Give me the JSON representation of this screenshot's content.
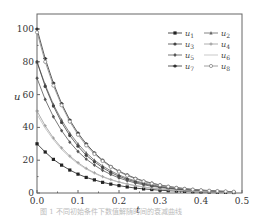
{
  "chart_data": {
    "type": "line",
    "title": "",
    "xlabel": "t",
    "ylabel": "u",
    "xlim": [
      0.0,
      0.5
    ],
    "ylim": [
      0,
      100
    ],
    "xticks": [
      "0.0",
      "0.1",
      "0.2",
      "0.3",
      "0.4",
      "0.5"
    ],
    "yticks": [
      "0",
      "20",
      "40",
      "60",
      "80",
      "100"
    ],
    "grid": false,
    "legend_position": "upper right",
    "x": [
      0.0,
      0.02,
      0.04,
      0.06,
      0.08,
      0.1,
      0.12,
      0.14,
      0.16,
      0.18,
      0.2,
      0.22,
      0.24,
      0.26,
      0.28,
      0.3,
      0.32,
      0.34,
      0.36,
      0.38,
      0.4,
      0.42,
      0.44,
      0.46,
      0.48
    ],
    "series": [
      {
        "name": "u1",
        "color": "#222222",
        "marker": "square",
        "values": [
          30,
          25,
          20.5,
          17,
          14,
          11.5,
          9.5,
          8,
          6.5,
          5.4,
          4.5,
          3.7,
          3.0,
          2.5,
          2.1,
          1.7,
          1.4,
          1.2,
          1.0,
          0.8,
          0.7,
          0.6,
          0.5,
          0.4,
          0.3
        ]
      },
      {
        "name": "u2",
        "color": "#666666",
        "marker": "triangle",
        "values": [
          80,
          66,
          54,
          44.5,
          36.5,
          30,
          24.5,
          20,
          16.5,
          13.5,
          11,
          9,
          7.4,
          6.1,
          5.0,
          4.1,
          3.4,
          2.8,
          2.3,
          1.9,
          1.5,
          1.3,
          1.0,
          0.9,
          0.7
        ]
      },
      {
        "name": "u3",
        "color": "#444444",
        "marker": "circle",
        "values": [
          80,
          65,
          53,
          43,
          35,
          28.5,
          23,
          19,
          15.5,
          12.5,
          10.2,
          8.3,
          6.8,
          5.5,
          4.5,
          3.7,
          3.0,
          2.4,
          2.0,
          1.6,
          1.3,
          1.1,
          0.9,
          0.7,
          0.6
        ]
      },
      {
        "name": "u4",
        "color": "#999999",
        "marker": "plus",
        "values": [
          50,
          41,
          33.5,
          27.5,
          22.5,
          18.5,
          15,
          12.3,
          10,
          8.2,
          6.7,
          5.5,
          4.5,
          3.7,
          3.0,
          2.5,
          2.0,
          1.7,
          1.4,
          1.1,
          0.9,
          0.8,
          0.6,
          0.5,
          0.4
        ]
      },
      {
        "name": "u5",
        "color": "#555555",
        "marker": "diamond",
        "values": [
          70,
          57,
          46.5,
          38,
          31,
          25.3,
          20.7,
          17,
          13.8,
          11.3,
          9.2,
          7.5,
          6.1,
          5.0,
          4.1,
          3.4,
          2.8,
          2.3,
          1.8,
          1.5,
          1.2,
          1.0,
          0.8,
          0.7,
          0.5
        ]
      },
      {
        "name": "u6",
        "color": "#bbbbbb",
        "marker": "none",
        "values": [
          48,
          39.5,
          32.5,
          26.5,
          21.8,
          17.8,
          14.6,
          12,
          9.8,
          8,
          6.6,
          5.4,
          4.4,
          3.6,
          2.9,
          2.4,
          2.0,
          1.6,
          1.3,
          1.1,
          0.9,
          0.7,
          0.6,
          0.5,
          0.4
        ]
      },
      {
        "name": "u7",
        "color": "#333333",
        "marker": "star",
        "values": [
          100,
          82,
          67,
          54.5,
          44.5,
          36.5,
          30,
          24.5,
          20,
          16.3,
          13.3,
          11,
          9,
          7.3,
          6.0,
          4.9,
          4.0,
          3.3,
          2.7,
          2.2,
          1.8,
          1.5,
          1.2,
          1.0,
          0.8
        ]
      },
      {
        "name": "u8",
        "color": "#888888",
        "marker": "circle-open",
        "values": [
          98,
          80,
          65.5,
          53.5,
          43.5,
          35.5,
          29,
          23.8,
          19.5,
          15.9,
          13,
          10.6,
          8.7,
          7.1,
          5.8,
          4.8,
          3.9,
          3.2,
          2.6,
          2.1,
          1.7,
          1.4,
          1.2,
          1.0,
          0.8
        ]
      }
    ]
  },
  "legend": {
    "items": [
      {
        "label": "u",
        "sub": "1"
      },
      {
        "label": "u",
        "sub": "2"
      },
      {
        "label": "u",
        "sub": "3"
      },
      {
        "label": "u",
        "sub": "4"
      },
      {
        "label": "u",
        "sub": "5"
      },
      {
        "label": "u",
        "sub": "6"
      },
      {
        "label": "u",
        "sub": "7"
      },
      {
        "label": "u",
        "sub": "8"
      }
    ]
  },
  "caption": "图 1  不同初始条件下数值解随时间的衰减曲线"
}
